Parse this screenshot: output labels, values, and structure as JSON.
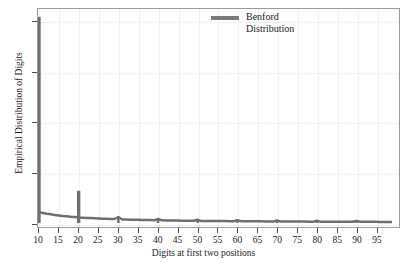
{
  "chart_data": {
    "type": "line",
    "title": "",
    "xlabel": "Digits at first two positions",
    "ylabel": "Empirical Distribution of Digits",
    "xlim": [
      10,
      99
    ],
    "ylim": [
      0.0,
      0.85
    ],
    "grid": true,
    "legend_position": "top-center",
    "xticks": [
      10,
      15,
      20,
      25,
      30,
      35,
      40,
      45,
      50,
      55,
      60,
      65,
      70,
      75,
      80,
      85,
      90,
      95
    ],
    "xtick_labels": [
      "10",
      "15",
      "20",
      "25",
      "30",
      "35",
      "40",
      "45",
      "50",
      "55",
      "60",
      "65",
      "70",
      "75",
      "80",
      "85",
      "90",
      "95"
    ],
    "yticks": [
      0.0,
      0.2,
      0.4,
      0.6,
      0.8
    ],
    "ytick_labels": [
      "0.0",
      "0.2",
      "0.4",
      "0.6",
      "0.8"
    ],
    "series": [
      {
        "name": "Benford Distribution",
        "color": "#6e6e6e",
        "x": [
          10,
          11,
          12,
          13,
          14,
          15,
          16,
          17,
          18,
          19,
          20,
          21,
          22,
          23,
          24,
          25,
          26,
          27,
          28,
          29,
          30,
          31,
          32,
          33,
          34,
          35,
          36,
          37,
          38,
          39,
          40,
          41,
          42,
          43,
          44,
          45,
          46,
          47,
          48,
          49,
          50,
          51,
          52,
          53,
          54,
          55,
          56,
          57,
          58,
          59,
          60,
          61,
          62,
          63,
          64,
          65,
          66,
          67,
          68,
          69,
          70,
          71,
          72,
          73,
          74,
          75,
          76,
          77,
          78,
          79,
          80,
          81,
          82,
          83,
          84,
          85,
          86,
          87,
          88,
          89,
          90,
          91,
          92,
          93,
          94,
          95,
          96,
          97,
          98,
          99
        ],
        "values": [
          0.819,
          0.04,
          0.037,
          0.035,
          0.032,
          0.03,
          0.028,
          0.027,
          0.025,
          0.024,
          0.128,
          0.021,
          0.02,
          0.02,
          0.019,
          0.018,
          0.017,
          0.017,
          0.016,
          0.016,
          0.024,
          0.014,
          0.014,
          0.013,
          0.013,
          0.013,
          0.012,
          0.012,
          0.012,
          0.011,
          0.016,
          0.011,
          0.01,
          0.01,
          0.01,
          0.01,
          0.009,
          0.009,
          0.009,
          0.009,
          0.013,
          0.008,
          0.008,
          0.008,
          0.008,
          0.008,
          0.008,
          0.008,
          0.007,
          0.007,
          0.011,
          0.007,
          0.007,
          0.007,
          0.007,
          0.007,
          0.007,
          0.006,
          0.006,
          0.006,
          0.01,
          0.006,
          0.006,
          0.006,
          0.006,
          0.006,
          0.006,
          0.006,
          0.005,
          0.005,
          0.009,
          0.005,
          0.005,
          0.005,
          0.005,
          0.005,
          0.005,
          0.005,
          0.005,
          0.005,
          0.008,
          0.005,
          0.005,
          0.005,
          0.005,
          0.005,
          0.004,
          0.004,
          0.004,
          0.004
        ],
        "spikes": [
          {
            "x": 10,
            "value": 0.819
          },
          {
            "x": 20,
            "value": 0.128
          }
        ]
      }
    ]
  },
  "legend": {
    "entries": [
      {
        "label": "Benford Distribution",
        "color": "#7a7a7a"
      }
    ]
  }
}
